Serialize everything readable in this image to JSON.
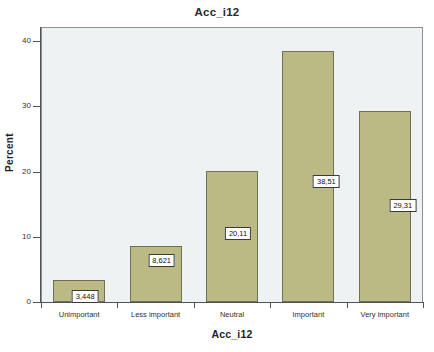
{
  "chart_data": {
    "type": "bar",
    "title": "Acc_i12",
    "xlabel": "Acc_i12",
    "ylabel": "Percent",
    "categories": [
      "Unimportant",
      "Less important",
      "Neutral",
      "Important",
      "Very important"
    ],
    "values": [
      3.448,
      8.621,
      20.11,
      38.51,
      29.31
    ],
    "value_labels": [
      "3,448",
      "8,621",
      "20,11",
      "38,51",
      "29,31"
    ],
    "ylim": [
      0,
      42
    ],
    "yticks": [
      0,
      10,
      20,
      30,
      40
    ],
    "ytick_labels": [
      "0",
      "10",
      "20",
      "30",
      "40"
    ],
    "grid": false,
    "legend": false,
    "bar_color": "#bcba84",
    "bar_border_color": "#6f6f55",
    "plot_background": "#eef2f3",
    "axis_color": "#4d5356",
    "decimal_separator": ","
  }
}
